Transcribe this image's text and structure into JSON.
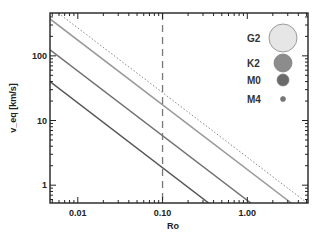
{
  "chart_data": {
    "type": "line",
    "title": "",
    "xlabel": "Ro",
    "ylabel": "v_eq [km/s]",
    "xscale": "log",
    "yscale": "log",
    "xlim": [
      0.0047,
      5.2
    ],
    "ylim": [
      0.53,
      460
    ],
    "grid": false,
    "legend_position": "upper right",
    "xticks": [
      {
        "value": 0.01,
        "label": "0.01"
      },
      {
        "value": 0.1,
        "label": "0.10"
      },
      {
        "value": 1.0,
        "label": "1.00"
      }
    ],
    "yticks": [
      {
        "value": 1,
        "label": "1"
      },
      {
        "value": 10,
        "label": "10"
      },
      {
        "value": 100,
        "label": "100"
      }
    ],
    "vline": {
      "x": 0.1,
      "style": "dashed"
    },
    "series": [
      {
        "name": "limit",
        "style": "dotted",
        "color": "#888888",
        "relation": "v = 2.7 / Ro",
        "x": [
          0.0047,
          5.0
        ],
        "y": [
          575,
          0.54
        ]
      },
      {
        "name": "G2",
        "style": "solid",
        "color": "#999999",
        "relation": "v = 1.75 / Ro",
        "x": [
          0.0047,
          3.3
        ],
        "y": [
          372,
          0.53
        ]
      },
      {
        "name": "K2",
        "style": "solid",
        "color": "#707070",
        "relation": "v = 0.58 / Ro",
        "x": [
          0.0047,
          1.1
        ],
        "y": [
          124,
          0.53
        ]
      },
      {
        "name": "M0",
        "style": "solid",
        "color": "#555555",
        "relation": "v = 0.19 / Ro",
        "x": [
          0.0047,
          0.35
        ],
        "y": [
          40,
          0.53
        ]
      }
    ],
    "legend": [
      {
        "label": "G2",
        "marker": "circle",
        "size": 14,
        "fill": "#e6e6e6"
      },
      {
        "label": "K2",
        "marker": "circle",
        "size": 9,
        "fill": "#8c8c8c"
      },
      {
        "label": "M0",
        "marker": "circle",
        "size": 6,
        "fill": "#6a6a6a"
      },
      {
        "label": "M4",
        "marker": "circle",
        "size": 2.5,
        "fill": "#777777"
      }
    ]
  }
}
